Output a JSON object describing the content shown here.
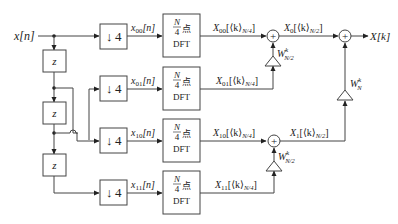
{
  "diagram": {
    "type": "radix-4 decimation-in-time FFT block diagram",
    "input": {
      "label": "x[n]"
    },
    "output": {
      "label": "X[k]"
    },
    "delays": [
      {
        "label": "z"
      },
      {
        "label": "z"
      },
      {
        "label": "z"
      }
    ],
    "downsamplers": [
      {
        "arrow": "↓",
        "factor": "4",
        "output": "x",
        "sub": "00",
        "tail": "[n]"
      },
      {
        "arrow": "↓",
        "factor": "4",
        "output": "x",
        "sub": "01",
        "tail": "[n]"
      },
      {
        "arrow": "↓",
        "factor": "4",
        "output": "x",
        "sub": "10",
        "tail": "[n]"
      },
      {
        "arrow": "↓",
        "factor": "4",
        "output": "x",
        "sub": "11",
        "tail": "[n]"
      }
    ],
    "dft_blocks": [
      {
        "num": "N",
        "den": "4",
        "suffix": "点",
        "name": "DFT"
      },
      {
        "num": "N",
        "den": "4",
        "suffix": "点",
        "name": "DFT"
      },
      {
        "num": "N",
        "den": "4",
        "suffix": "点",
        "name": "DFT"
      },
      {
        "num": "N",
        "den": "4",
        "suffix": "点",
        "name": "DFT"
      }
    ],
    "dft_outputs": [
      {
        "base": "X",
        "sub": "00",
        "mid": "[⟨k⟩",
        "idx": "N/4",
        "end": "]"
      },
      {
        "base": "X",
        "sub": "01",
        "mid": "[⟨k⟩",
        "idx": "N/4",
        "end": "]"
      },
      {
        "base": "X",
        "sub": "10",
        "mid": "[⟨k⟩",
        "idx": "N/4",
        "end": "]"
      },
      {
        "base": "X",
        "sub": "11",
        "mid": "[⟨k⟩",
        "idx": "N/4",
        "end": "]"
      }
    ],
    "intermediate": [
      {
        "base": "X",
        "sub": "0",
        "mid": "[⟨k⟩",
        "idx": "N/2",
        "end": "]"
      },
      {
        "base": "X",
        "sub": "1",
        "mid": "[⟨k⟩",
        "idx": "N/2",
        "end": "]"
      }
    ],
    "twiddles": [
      {
        "base": "W",
        "sup": "k",
        "sub": "N/2"
      },
      {
        "base": "W",
        "sup": "k",
        "sub": "N/2"
      },
      {
        "base": "W",
        "sup": "k",
        "sub": "N"
      }
    ],
    "adder_symbol": "+"
  }
}
